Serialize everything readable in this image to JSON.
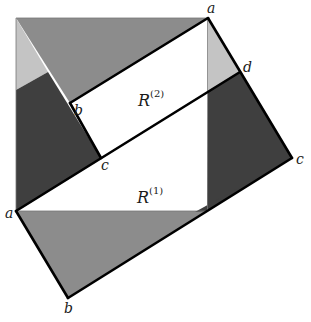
{
  "diagram": {
    "colors": {
      "medium_gray": "#8c8c8c",
      "dark_gray": "#3f3f3f",
      "light_gray": "#c4c4c4",
      "white": "#ffffff",
      "line": "#000000"
    },
    "labels": {
      "a_top": "a",
      "d": "d",
      "c_right": "c",
      "b_inner": "b",
      "c_inner": "c",
      "a_left": "a",
      "b_bottom": "b",
      "R2_base": "R",
      "R2_sup": "(2)",
      "R1_base": "R",
      "R1_sup": "(1)"
    }
  }
}
